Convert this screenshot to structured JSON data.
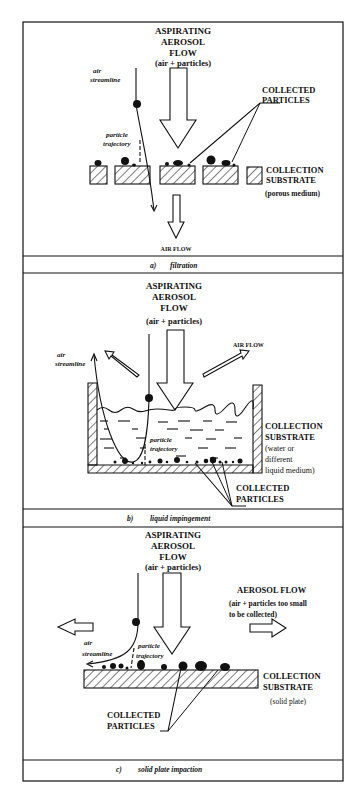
{
  "figure": {
    "panels": [
      {
        "id": "a",
        "caption_letter": "a)",
        "caption_text": "filtration",
        "title_lines": [
          "ASPIRATING",
          "AEROSOL",
          "FLOW",
          "(air + particles)"
        ],
        "air_streamline_label": [
          "air",
          "streamline"
        ],
        "particle_trajectory_label": [
          "particle",
          "trajectory"
        ],
        "collected_particles_label": [
          "COLLECTED",
          "PARTICLES"
        ],
        "substrate_label": [
          "COLLECTION",
          "SUBSTRATE",
          "(porous medium)"
        ],
        "outflow_label": "AIR FLOW"
      },
      {
        "id": "b",
        "caption_letter": "b)",
        "caption_text": "liquid impingement",
        "title_lines": [
          "ASPIRATING",
          "AEROSOL",
          "FLOW",
          "(air + particles)"
        ],
        "air_streamline_label": [
          "air",
          "streamline"
        ],
        "particle_trajectory_label": [
          "particle",
          "trajectory"
        ],
        "air_flow_label": "AIR FLOW",
        "substrate_label": [
          "COLLECTION",
          "SUBSTRATE",
          "(water or",
          "different",
          "liquid medium)"
        ],
        "collected_particles_label": [
          "COLLECTED",
          "PARTICLES"
        ]
      },
      {
        "id": "c",
        "caption_letter": "c)",
        "caption_text": "solid plate impaction",
        "title_lines": [
          "ASPIRATING",
          "AEROSOL",
          "FLOW",
          "(air + particles)"
        ],
        "air_streamline_label": [
          "air",
          "streamline"
        ],
        "particle_trajectory_label": [
          "particle",
          "trajectory"
        ],
        "aerosol_flow_label": [
          "AEROSOL FLOW",
          "(air + particles too small",
          "to be collected)"
        ],
        "substrate_label": [
          "COLLECTION",
          "SUBSTRATE",
          "(solid plate)"
        ],
        "collected_particles_label": [
          "COLLECTED",
          "PARTICLES"
        ]
      }
    ]
  }
}
